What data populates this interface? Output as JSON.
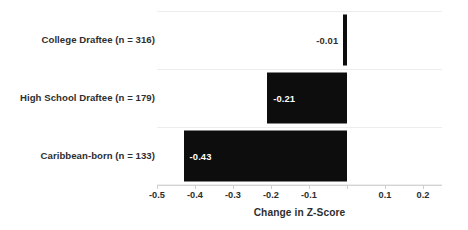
{
  "chart_data": {
    "type": "bar",
    "orientation": "horizontal",
    "title": "",
    "subtitle": "",
    "xlabel": "Change in Z-Score",
    "ylabel": "",
    "categories": [
      "College Draftee (n = 316)",
      "High School Draftee (n = 179)",
      "Caribbean-born (n = 133)"
    ],
    "values": [
      -0.01,
      -0.21,
      -0.43
    ],
    "data_labels": [
      "-0.01",
      "-0.21",
      "-0.43"
    ],
    "xlim": [
      -0.5,
      0.25
    ],
    "ylim": null,
    "xticks": [
      -0.5,
      -0.4,
      -0.3,
      -0.2,
      -0.1,
      0,
      0.1,
      0.2
    ],
    "xtick_labels": [
      "-0.5",
      "-0.4",
      "-0.3",
      "-0.2",
      "-0.1",
      "",
      "0.1",
      "0.2"
    ],
    "grid": "horizontal-only",
    "legend": "none",
    "bar_color": "#0d0d0d",
    "gridline_color": "#ededed",
    "axis_color": "#d4d4d4",
    "text_color": "#2e2e2e",
    "inside_label_color": "#ffffff"
  },
  "axis": {
    "x_title": "Change in Z-Score",
    "tick_labels": [
      "-0.5",
      "-0.4",
      "-0.3",
      "-0.2",
      "-0.1",
      "",
      "0.1",
      "0.2"
    ]
  },
  "bars": [
    {
      "label": "College Draftee (n = 316)",
      "value_text": "-0.01"
    },
    {
      "label": "High School Draftee (n = 179)",
      "value_text": "-0.21"
    },
    {
      "label": "Caribbean-born (n = 133)",
      "value_text": "-0.43"
    }
  ]
}
